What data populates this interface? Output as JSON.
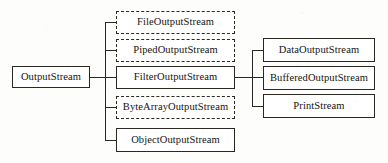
{
  "diagram": {
    "type": "class-hierarchy",
    "width": 388,
    "height": 163,
    "line_color": "#2b2824",
    "box_fill": "#ffffff",
    "background": "#fdfdfc",
    "nodes": [
      {
        "id": "output-stream",
        "label": "OutputStream",
        "border": "solid",
        "column": "root",
        "x": 12,
        "y": 66,
        "w": 78,
        "h": 22
      },
      {
        "id": "file-output-stream",
        "label": "FileOutputStream",
        "border": "dashed",
        "column": "middle",
        "x": 116,
        "y": 11,
        "w": 119,
        "h": 23
      },
      {
        "id": "piped-output-stream",
        "label": "PipedOutputStream",
        "border": "dashed",
        "column": "middle",
        "x": 116,
        "y": 39,
        "w": 119,
        "h": 23
      },
      {
        "id": "filter-output-stream",
        "label": "FilterOutputStream",
        "border": "solid",
        "column": "middle",
        "x": 116,
        "y": 66,
        "w": 119,
        "h": 23
      },
      {
        "id": "byte-array-output-stream",
        "label": "ByteArrayOutputStream",
        "border": "dashed",
        "column": "middle",
        "x": 116,
        "y": 96,
        "w": 119,
        "h": 23
      },
      {
        "id": "object-output-stream",
        "label": "ObjectOutputStream",
        "border": "solid",
        "column": "middle",
        "x": 116,
        "y": 128,
        "w": 119,
        "h": 24
      },
      {
        "id": "data-output-stream",
        "label": "DataOutputStream",
        "border": "solid",
        "column": "right",
        "x": 263,
        "y": 38,
        "w": 112,
        "h": 24
      },
      {
        "id": "buffered-output-stream",
        "label": "BufferedOutputStream",
        "border": "solid",
        "column": "right",
        "x": 263,
        "y": 66,
        "w": 112,
        "h": 24
      },
      {
        "id": "print-stream",
        "label": "PrintStream",
        "border": "solid",
        "column": "right",
        "x": 263,
        "y": 94,
        "w": 112,
        "h": 24
      }
    ],
    "edges": [
      {
        "from": "output-stream",
        "to": "file-output-stream"
      },
      {
        "from": "output-stream",
        "to": "piped-output-stream"
      },
      {
        "from": "output-stream",
        "to": "filter-output-stream"
      },
      {
        "from": "output-stream",
        "to": "byte-array-output-stream"
      },
      {
        "from": "output-stream",
        "to": "object-output-stream"
      },
      {
        "from": "filter-output-stream",
        "to": "data-output-stream"
      },
      {
        "from": "filter-output-stream",
        "to": "buffered-output-stream"
      },
      {
        "from": "filter-output-stream",
        "to": "print-stream"
      }
    ]
  }
}
